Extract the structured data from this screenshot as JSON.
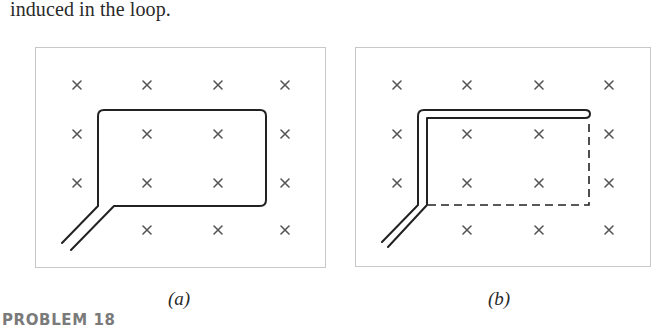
{
  "intro_text": "induced in the loop.",
  "figures": [
    {
      "id": "a",
      "caption": "(a)",
      "description": "Closed rectangular wire loop with twisted-pair leads in a uniform magnetic field directed into the page",
      "field_symbol": "×",
      "field_direction": "into-page",
      "loop_style": "solid rectangle"
    },
    {
      "id": "b",
      "caption": "(b)",
      "description": "Wire folded back on itself (doubled) with dashed outline showing the former loop area, in the same field into the page",
      "field_symbol": "×",
      "field_direction": "into-page",
      "loop_style": "collapsed double wire with dashed former outline"
    }
  ],
  "field_grid": {
    "rows": 4,
    "cols": 4
  },
  "problem_label": "PROBLEM 18",
  "colors": {
    "text": "#2a2a2a",
    "frame": "#c8c8c8",
    "wire": "#222222",
    "field_mark": "#555555",
    "problem_label": "#7a7a7a"
  }
}
